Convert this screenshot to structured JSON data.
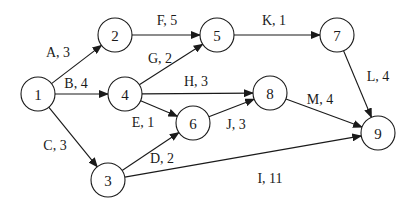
{
  "diagram": {
    "type": "activity-on-arrow network",
    "node_radius": 17,
    "nodes": [
      {
        "id": "1",
        "label": "1",
        "x": 38,
        "y": 94
      },
      {
        "id": "2",
        "label": "2",
        "x": 115,
        "y": 35
      },
      {
        "id": "3",
        "label": "3",
        "x": 108,
        "y": 180
      },
      {
        "id": "4",
        "label": "4",
        "x": 125,
        "y": 94
      },
      {
        "id": "5",
        "label": "5",
        "x": 217,
        "y": 35
      },
      {
        "id": "6",
        "label": "6",
        "x": 193,
        "y": 123
      },
      {
        "id": "7",
        "label": "7",
        "x": 337,
        "y": 35
      },
      {
        "id": "8",
        "label": "8",
        "x": 270,
        "y": 93
      },
      {
        "id": "9",
        "label": "9",
        "x": 378,
        "y": 133
      }
    ],
    "edges": [
      {
        "from": "1",
        "to": "2",
        "activity": "A",
        "duration": 3,
        "label": "A, 3",
        "lx": 58,
        "ly": 52
      },
      {
        "from": "1",
        "to": "4",
        "activity": "B",
        "duration": 4,
        "label": "B, 4",
        "lx": 76,
        "ly": 83
      },
      {
        "from": "1",
        "to": "3",
        "activity": "C",
        "duration": 3,
        "label": "C, 3",
        "lx": 55,
        "ly": 145
      },
      {
        "from": "3",
        "to": "6",
        "activity": "D",
        "duration": 2,
        "label": "D, 2",
        "lx": 162,
        "ly": 158
      },
      {
        "from": "4",
        "to": "6",
        "activity": "E",
        "duration": 1,
        "label": "E, 1",
        "lx": 143,
        "ly": 122
      },
      {
        "from": "2",
        "to": "5",
        "activity": "F",
        "duration": 5,
        "label": "F, 5",
        "lx": 167,
        "ly": 20
      },
      {
        "from": "4",
        "to": "5",
        "activity": "G",
        "duration": 2,
        "label": "G, 2",
        "lx": 160,
        "ly": 58
      },
      {
        "from": "4",
        "to": "8",
        "activity": "H",
        "duration": 3,
        "label": "H, 3",
        "lx": 196,
        "ly": 81
      },
      {
        "from": "3",
        "to": "9",
        "activity": "I",
        "duration": 11,
        "label": "I, 11",
        "lx": 270,
        "ly": 178
      },
      {
        "from": "6",
        "to": "8",
        "activity": "J",
        "duration": 3,
        "label": "J, 3",
        "lx": 236,
        "ly": 124
      },
      {
        "from": "5",
        "to": "7",
        "activity": "K",
        "duration": 1,
        "label": "K, 1",
        "lx": 274,
        "ly": 20
      },
      {
        "from": "7",
        "to": "9",
        "activity": "L",
        "duration": 4,
        "label": "L, 4",
        "lx": 378,
        "ly": 76
      },
      {
        "from": "8",
        "to": "9",
        "activity": "M",
        "duration": 4,
        "label": "M, 4",
        "lx": 320,
        "ly": 99
      }
    ]
  }
}
